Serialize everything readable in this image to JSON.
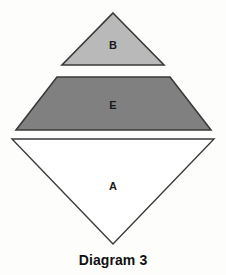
{
  "figure": {
    "caption": "Diagram 3",
    "background_color": "#fdfdfc",
    "stroke_color": "#3a3a3a",
    "shapes": [
      {
        "id": "B",
        "label": "B",
        "kind": "triangle-up",
        "fill_color": "#b9b9b9",
        "apex": {
          "x": 113,
          "y": 13
        },
        "base_left": {
          "x": 62,
          "y": 65
        },
        "base_right": {
          "x": 164,
          "y": 65
        },
        "label_position": {
          "x": 113,
          "y": 45
        }
      },
      {
        "id": "E",
        "label": "E",
        "kind": "trapezoid",
        "fill_color": "#808080",
        "top_left": {
          "x": 57,
          "y": 77
        },
        "top_right": {
          "x": 170,
          "y": 77
        },
        "bottom_right": {
          "x": 211,
          "y": 130
        },
        "bottom_left": {
          "x": 16,
          "y": 130
        },
        "label_position": {
          "x": 113,
          "y": 105
        }
      },
      {
        "id": "A",
        "label": "A",
        "kind": "triangle-down",
        "fill_color": "#ffffff",
        "top_left": {
          "x": 12,
          "y": 139
        },
        "top_right": {
          "x": 214,
          "y": 139
        },
        "apex": {
          "x": 113,
          "y": 244
        },
        "label_position": {
          "x": 113,
          "y": 186
        }
      }
    ]
  }
}
